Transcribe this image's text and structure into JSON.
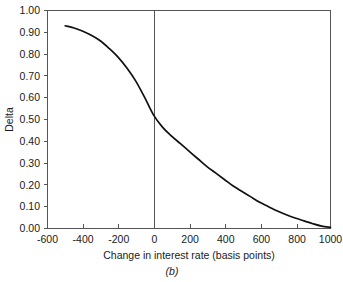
{
  "chart_data": {
    "type": "line",
    "title": "",
    "subtitle": "",
    "xlabel": "Change in interest rate (basis points)",
    "ylabel": "Delta",
    "xlim": [
      -600,
      1000
    ],
    "ylim": [
      0.0,
      1.0
    ],
    "grid": false,
    "legend": null,
    "legend_position": "none",
    "xticks": [
      -600,
      -400,
      -200,
      0,
      200,
      400,
      600,
      800,
      1000
    ],
    "xtick_labels": [
      "-600",
      "-400",
      "-200",
      "0",
      "200",
      "400",
      "600",
      "800",
      "1000"
    ],
    "yticks": [
      0.0,
      0.1,
      0.2,
      0.3,
      0.4,
      0.5,
      0.6,
      0.7,
      0.8,
      0.9,
      1.0
    ],
    "ytick_labels": [
      "0.00",
      "0.10",
      "0.20",
      "0.30",
      "0.40",
      "0.50",
      "0.60",
      "0.70",
      "0.80",
      "0.90",
      "1.00"
    ],
    "annotations": [
      {
        "name": "zero-reference-line",
        "type": "vline",
        "x": 0
      }
    ],
    "series": [
      {
        "name": "Delta",
        "x": [
          -500,
          -450,
          -400,
          -350,
          -300,
          -250,
          -200,
          -150,
          -100,
          -50,
          0,
          50,
          100,
          150,
          200,
          250,
          300,
          350,
          400,
          450,
          500,
          550,
          600,
          650,
          700,
          750,
          800,
          850,
          900,
          950,
          1000
        ],
        "values": [
          0.93,
          0.92,
          0.905,
          0.885,
          0.86,
          0.825,
          0.785,
          0.735,
          0.675,
          0.6,
          0.52,
          0.465,
          0.425,
          0.39,
          0.355,
          0.32,
          0.285,
          0.255,
          0.225,
          0.195,
          0.17,
          0.145,
          0.12,
          0.1,
          0.08,
          0.063,
          0.048,
          0.035,
          0.022,
          0.011,
          0.005
        ]
      }
    ]
  },
  "figure": {
    "caption": "(b)"
  },
  "colors": {
    "curve": "#111111",
    "axis": "#555555",
    "text": "#1a1a1a",
    "background": "#ffffff"
  }
}
